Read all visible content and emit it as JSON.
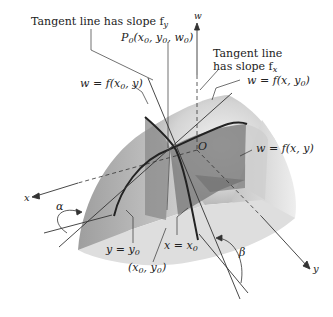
{
  "diagram": {
    "labels": {
      "tangent_fy": "Tangent line has slope f",
      "tangent_fy_sub": "y",
      "point_p0_main": "P",
      "point_p0_sub": "0",
      "point_p0_args": "(x",
      "point_p0_args2": ", y",
      "point_p0_args3": ", w",
      "point_p0_close": ")",
      "w_axis": "w",
      "tangent_fx_line1": "Tangent line",
      "tangent_fx_line2": "has slope f",
      "tangent_fx_sub": "x",
      "curve_x0": "w = f(x",
      "curve_x0_tail": ", y)",
      "curve_y0": "w = f(x, y",
      "curve_y0_tail": ")",
      "origin": "O",
      "surface": "w = f(x, y)",
      "x_axis": "x",
      "y_axis": "y",
      "alpha": "α",
      "beta": "β",
      "plane_y0": "y = y",
      "plane_x0": "x = x",
      "point_xy0": "(x",
      "point_xy0_mid": ", y",
      "point_xy0_close": ")",
      "zero_sub": "0"
    },
    "colors": {
      "surface_light": "#e6e6e6",
      "surface_mid": "#c9c9c9",
      "surface_dark": "#8f8f8f",
      "plane_dark": "#7d7d7d",
      "line": "#333333",
      "curve": "#222222"
    }
  }
}
